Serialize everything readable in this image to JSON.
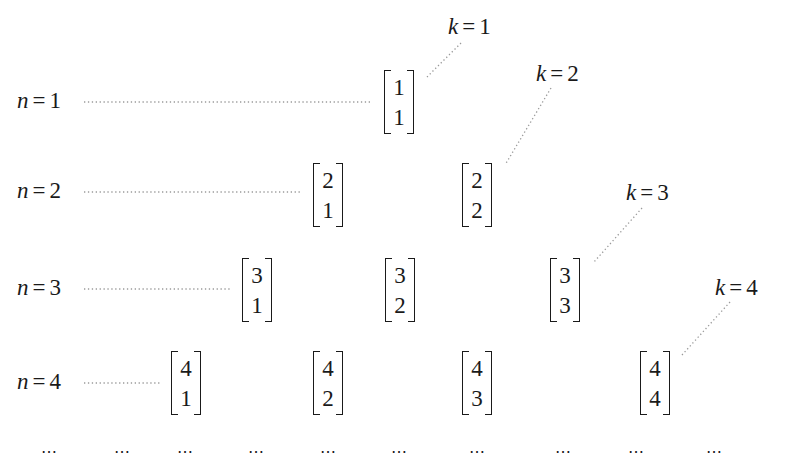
{
  "diagram": {
    "type": "triangular array of binomial-style vectors",
    "row_labels": [
      {
        "var": "n",
        "eq": "=",
        "val": "1"
      },
      {
        "var": "n",
        "eq": "=",
        "val": "2"
      },
      {
        "var": "n",
        "eq": "=",
        "val": "3"
      },
      {
        "var": "n",
        "eq": "=",
        "val": "4"
      }
    ],
    "column_labels": [
      {
        "var": "k",
        "eq": "=",
        "val": "1"
      },
      {
        "var": "k",
        "eq": "=",
        "val": "2"
      },
      {
        "var": "k",
        "eq": "=",
        "val": "3"
      },
      {
        "var": "k",
        "eq": "=",
        "val": "4"
      }
    ],
    "rows": [
      [
        {
          "top": "1",
          "bottom": "1"
        }
      ],
      [
        {
          "top": "2",
          "bottom": "1"
        },
        {
          "top": "2",
          "bottom": "2"
        }
      ],
      [
        {
          "top": "3",
          "bottom": "1"
        },
        {
          "top": "3",
          "bottom": "2"
        },
        {
          "top": "3",
          "bottom": "3"
        }
      ],
      [
        {
          "top": "4",
          "bottom": "1"
        },
        {
          "top": "4",
          "bottom": "2"
        },
        {
          "top": "4",
          "bottom": "3"
        },
        {
          "top": "4",
          "bottom": "4"
        }
      ]
    ],
    "continuation": [
      "⋯",
      "⋯",
      "⋯",
      "⋯",
      "⋯",
      "⋯",
      "⋯",
      "⋯",
      "⋯",
      "⋯"
    ]
  }
}
